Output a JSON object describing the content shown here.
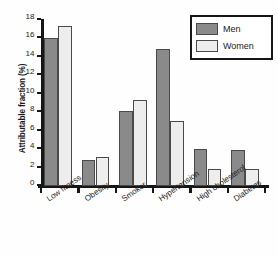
{
  "chart_data": {
    "type": "bar",
    "title": "",
    "xlabel": "",
    "ylabel": "Attributable fraction (%)",
    "categories": [
      "Low fitness",
      "Obesity",
      "Smoker",
      "Hypertension",
      "High cholesterol",
      "Diabetes"
    ],
    "series": [
      {
        "name": "Men",
        "values": [
          16.1,
          2.8,
          8.1,
          14.9,
          4.0,
          3.9
        ],
        "color": "#8a8a8a"
      },
      {
        "name": "Women",
        "values": [
          17.3,
          3.2,
          9.3,
          7.1,
          1.8,
          1.8
        ],
        "color": "#ededed"
      }
    ],
    "ylim": [
      0,
      18
    ],
    "yticks": [
      0,
      2,
      4,
      6,
      8,
      10,
      12,
      14,
      16,
      18
    ],
    "ytick_labels": [
      "0",
      "2",
      "4",
      "6",
      "8",
      "10",
      "12",
      "14",
      "16",
      "18"
    ],
    "grid": false,
    "legend_position": "top-right",
    "legend_entries": [
      "Men",
      "Women"
    ],
    "axis_color": "#161616",
    "bar_edge_color": "#4a4a4a",
    "background": "#ffffff"
  },
  "legend": {
    "men_label": "Men",
    "women_label": "Women"
  }
}
